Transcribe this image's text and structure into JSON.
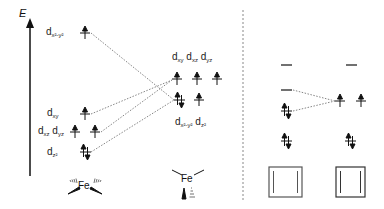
{
  "axis": {
    "label": "E"
  },
  "left_panel": {
    "geometry": "square-planar Fe",
    "metal_label": "Fe",
    "orbitals": [
      {
        "id": "dx2y2",
        "base": "d",
        "sub": "x²-y²",
        "electrons": "up"
      },
      {
        "id": "dxy",
        "base": "d",
        "sub": "xy",
        "electrons": "up"
      },
      {
        "id": "dxz",
        "base": "d",
        "sub": "xz",
        "electrons": "up"
      },
      {
        "id": "dyz",
        "base": "d",
        "sub": "yz",
        "electrons": "up"
      },
      {
        "id": "dz2",
        "base": "d",
        "sub": "z²",
        "electrons": "paired"
      }
    ]
  },
  "middle_panel": {
    "geometry": "tetrahedral-like Fe",
    "metal_label": "Fe",
    "upper_labels": [
      {
        "base": "d",
        "sub": "xy"
      },
      {
        "base": "d",
        "sub": "xz"
      },
      {
        "base": "d",
        "sub": "yz"
      }
    ],
    "lower_labels": [
      {
        "base": "d",
        "sub": "x²-y²"
      },
      {
        "base": "d",
        "sub": "z²"
      }
    ],
    "upper_electrons": [
      "up",
      "up",
      "up"
    ],
    "lower_electrons": [
      "paired",
      "up"
    ]
  },
  "right_panel": {
    "columns": [
      {
        "levels": [
          "empty",
          "empty",
          "paired",
          "paired"
        ],
        "box": "double-bar square"
      },
      {
        "levels": [
          "empty",
          "up up",
          "paired"
        ],
        "box": "double-bar square"
      }
    ]
  },
  "colors": {
    "line": "#111111",
    "dotted": "#777777",
    "divider": "#888888"
  }
}
